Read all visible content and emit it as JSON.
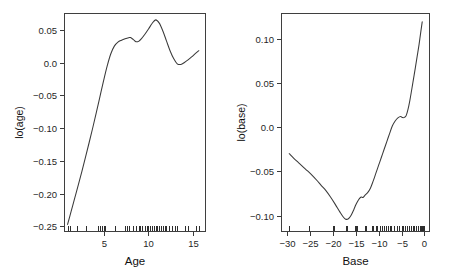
{
  "figure": {
    "background": "#ffffff",
    "line_color": "#3a3a3a",
    "axis_color": "#3b3b3b",
    "text_color": "#1a1a1a",
    "width": 452,
    "height": 278,
    "panel_count": 2
  },
  "chart_data": [
    {
      "type": "line",
      "panel": "left",
      "title": "",
      "xlabel": "Age",
      "ylabel": "lo(age)",
      "xlim": [
        0.6,
        16.4
      ],
      "ylim": [
        -0.2585,
        0.0755
      ],
      "xticks": [
        5,
        10,
        15
      ],
      "xticklabels": [
        "5",
        "10",
        "15"
      ],
      "yticks": [
        0.05,
        0.0,
        -0.05,
        -0.1,
        -0.15,
        -0.2,
        -0.25
      ],
      "yticklabels": [
        "0.05",
        "0.0",
        "-0.05",
        "-0.10",
        "-0.15",
        "-0.20",
        "-0.25"
      ],
      "grid": false,
      "legend": null,
      "x": [
        1.0,
        1.4,
        1.8,
        2.2,
        2.6,
        3.0,
        3.4,
        3.8,
        4.2,
        4.6,
        5.0,
        5.4,
        5.8,
        6.2,
        6.6,
        7.0,
        7.4,
        7.8,
        8.0,
        8.3,
        8.6,
        8.9,
        9.2,
        9.6,
        10.0,
        10.4,
        10.8,
        11.2,
        11.6,
        12.0,
        12.4,
        12.8,
        13.2,
        13.6,
        14.0,
        14.4,
        14.8,
        15.2,
        15.6
      ],
      "y": [
        -0.247,
        -0.2268,
        -0.2066,
        -0.1864,
        -0.1655,
        -0.144,
        -0.122,
        -0.0995,
        -0.076,
        -0.052,
        -0.028,
        -0.0055,
        0.013,
        0.025,
        0.031,
        0.034,
        0.0362,
        0.0378,
        0.038,
        0.0352,
        0.0318,
        0.0322,
        0.036,
        0.043,
        0.051,
        0.0595,
        0.065,
        0.06,
        0.048,
        0.033,
        0.018,
        0.006,
        -0.002,
        -0.003,
        0.0,
        0.004,
        0.0085,
        0.0135,
        0.018
      ],
      "rug_values": [
        1.0,
        1.3,
        2.0,
        3.1,
        4.4,
        4.6,
        4.8,
        5.0,
        5.2,
        6.3,
        7.4,
        7.6,
        7.8,
        8.3,
        8.6,
        8.9,
        9.1,
        9.3,
        9.6,
        9.8,
        10.0,
        10.2,
        10.4,
        10.6,
        10.8,
        11.0,
        11.2,
        11.4,
        11.6,
        11.8,
        12.0,
        12.3,
        12.6,
        12.9,
        13.2,
        14.1,
        14.4,
        15.3,
        15.6
      ]
    },
    {
      "type": "line",
      "panel": "right",
      "title": "",
      "xlabel": "Base",
      "ylabel": "lo(base)",
      "xlim": [
        -31.3,
        1.2
      ],
      "ylim": [
        -0.1185,
        0.129
      ],
      "xticks": [
        -30,
        -25,
        -20,
        -15,
        -10,
        -5,
        0
      ],
      "xticklabels": [
        "-30",
        "-25",
        "-20",
        "-15",
        "-10",
        "-5",
        "0"
      ],
      "yticks": [
        0.1,
        0.05,
        0.0,
        -0.05,
        -0.1
      ],
      "yticklabels": [
        "0.10",
        "0.05",
        "0.0",
        "-0.05",
        "-0.10"
      ],
      "grid": false,
      "legend": null,
      "x": [
        -29.5,
        -28.5,
        -27.5,
        -26.5,
        -25.5,
        -24.5,
        -23.5,
        -22.5,
        -21.5,
        -20.5,
        -19.5,
        -18.5,
        -17.8,
        -17.2,
        -16.6,
        -16.0,
        -15.4,
        -15.0,
        -14.6,
        -14.2,
        -13.8,
        -13.4,
        -13.0,
        -12.4,
        -11.8,
        -11.2,
        -10.6,
        -10.0,
        -9.4,
        -8.8,
        -8.2,
        -7.6,
        -7.0,
        -6.4,
        -5.8,
        -5.2,
        -4.8,
        -4.4,
        -4.0,
        -3.6,
        -3.2,
        -2.8,
        -2.4,
        -2.0,
        -1.6,
        -1.2,
        -0.8,
        -0.5
      ],
      "y": [
        -0.03,
        -0.0352,
        -0.04,
        -0.0448,
        -0.0495,
        -0.0545,
        -0.06,
        -0.066,
        -0.0718,
        -0.079,
        -0.087,
        -0.0955,
        -0.101,
        -0.104,
        -0.1035,
        -0.0995,
        -0.093,
        -0.088,
        -0.084,
        -0.0808,
        -0.079,
        -0.0795,
        -0.077,
        -0.074,
        -0.069,
        -0.061,
        -0.052,
        -0.043,
        -0.034,
        -0.025,
        -0.016,
        -0.007,
        0.0015,
        0.007,
        0.0105,
        0.012,
        0.0108,
        0.011,
        0.013,
        0.02,
        0.03,
        0.042,
        0.0545,
        0.067,
        0.08,
        0.093,
        0.108,
        0.119
      ],
      "rug_values": [
        -29.5,
        -25.2,
        -20.0,
        -19.8,
        -17.2,
        -17.0,
        -16.8,
        -15.2,
        -15.0,
        -14.8,
        -13.0,
        -12.8,
        -11.4,
        -11.2,
        -10.6,
        -10.4,
        -9.8,
        -9.2,
        -8.8,
        -8.4,
        -8.0,
        -7.6,
        -7.2,
        -6.6,
        -6.0,
        -5.6,
        -5.0,
        -4.6,
        -4.2,
        -3.8,
        -3.4,
        -3.0,
        -2.6,
        -2.2,
        -1.8,
        -1.4,
        -1.0,
        -0.8,
        -0.6,
        -0.4,
        -0.3,
        -0.2,
        -0.1
      ]
    }
  ],
  "panels": {
    "left": {
      "name": "lo-age-panel",
      "ylabel": "lo(age)",
      "xlabel": "Age"
    },
    "right": {
      "name": "lo-base-panel",
      "ylabel": "lo(base)",
      "xlabel": "Base"
    }
  }
}
